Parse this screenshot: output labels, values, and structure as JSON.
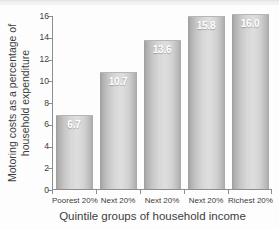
{
  "chart_data": {
    "type": "bar",
    "title": "",
    "subtitle": "",
    "xlabel": "Quintile groups of household income",
    "ylabel": "Motoring costs as a percentage of household expenditure",
    "ylabel_line1": "Motoring costs as a percentage of",
    "ylabel_line2": "household expenditure",
    "categories": [
      "Poorest 20%",
      "Next 20%",
      "Next 20%",
      "Next 20%",
      "Richest 20%"
    ],
    "values": [
      6.7,
      10.7,
      13.6,
      15.8,
      16.0
    ],
    "value_labels": [
      "6.7",
      "10.7",
      "13.6",
      "15.8",
      "16.0"
    ],
    "ylim": [
      0,
      16
    ],
    "yticks": [
      0,
      2,
      4,
      6,
      8,
      10,
      12,
      14,
      16
    ],
    "ytick_labels": [
      "0",
      "2",
      "4",
      "6",
      "8",
      "10",
      "12",
      "14",
      "16"
    ],
    "grid": false,
    "legend": null,
    "legend_position": "none",
    "bar_color": "#cfcfcf",
    "value_label_color": "#ffffff",
    "axis_color": "#8e8e8e",
    "text_color": "#3d3d3d",
    "background_color": "#fdfdfd"
  }
}
